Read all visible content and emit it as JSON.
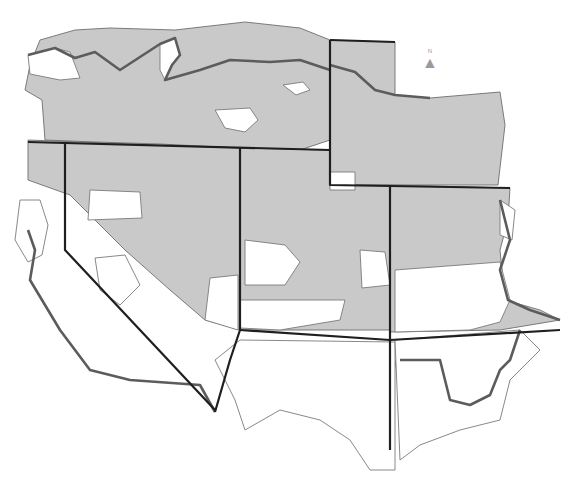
{
  "map": {
    "title": "",
    "background": "#ffffff",
    "colors": {
      "shaded": "#c9c9c9",
      "unshaded": "#ffffff",
      "county_border": "#6e6e6e",
      "state_border": "#1f1f1f",
      "region_border": "#5c5c5c"
    },
    "north_arrow": {
      "label": "N",
      "glyph": "▲"
    },
    "legend": {
      "shaded_meaning": "shaded county",
      "unshaded_meaning": "unshaded county"
    },
    "shaded_regions": [
      "M 40 40 L 75 30 L 110 28 L 175 30 L 245 22 L 300 28 L 330 40 L 330 140 L 300 150 L 240 148 L 200 146 L 160 144 L 95 142 L 45 140 L 42 100 L 25 90 L 30 65 Z",
      "M 330 40 L 395 42 L 395 95 L 430 98 L 500 92 L 505 125 L 498 185 L 330 185 Z",
      "M 28 140 L 240 148 L 240 330 L 205 320 L 170 290 L 125 250 L 70 195 L 28 180 Z",
      "M 240 148 L 330 150 L 330 185 L 390 185 L 390 330 L 240 330 Z",
      "M 390 185 L 510 188 L 508 220 L 500 250 L 505 300 L 540 310 L 560 320 L 500 330 L 390 332 Z",
      "M 395 360 L 440 360 L 440 385 L 420 390 L 400 395 Z"
    ],
    "unshaded_regions": [
      "M 28 55 L 55 48 L 70 52 L 80 78 L 60 80 L 30 74 Z",
      "M 160 44 L 175 38 L 180 55 L 172 65 L 165 80 L 160 70 Z",
      "M 283 85 L 303 82 L 310 90 L 296 95 Z",
      "M 215 110 L 250 108 L 258 120 L 245 132 L 225 128 Z",
      "M 330 172 L 355 172 L 355 190 L 330 190 Z",
      "M 90 190 L 140 192 L 142 218 L 88 220 Z",
      "M 20 200 L 40 200 L 48 225 L 42 255 L 28 262 L 15 240 Z",
      "M 95 258 L 125 255 L 140 285 L 120 305 L 100 290 Z",
      "M 210 278 L 238 275 L 238 330 L 205 320 Z",
      "M 245 240 L 285 245 L 300 262 L 285 285 L 245 285 Z",
      "M 240 300 L 345 300 L 340 320 L 280 330 L 240 328 Z",
      "M 360 250 L 385 252 L 390 285 L 362 288 Z",
      "M 395 270 L 500 262 L 510 300 L 500 322 L 470 330 L 395 332 Z",
      "M 500 200 L 515 210 L 512 240 L 500 235 Z",
      "M 240 340 L 395 342 L 395 470 L 370 470 L 350 440 L 320 420 L 280 410 L 245 430 L 235 400 L 215 360 Z",
      "M 395 340 L 520 330 L 540 350 L 510 380 L 500 420 L 460 430 L 420 445 L 400 460 Z"
    ],
    "state_borders": [
      "M 28 142 L 330 150 L 330 185 L 510 188",
      "M 65 142 L 65 250 L 215 410",
      "M 240 148 L 240 330 L 230 360 L 215 412",
      "M 330 40 L 395 42",
      "M 330 40 L 330 150",
      "M 240 330 L 390 340 L 560 330",
      "M 390 185 L 390 450"
    ],
    "region_outlines": [
      "M 28 55 L 55 48 L 75 58 L 95 52 L 120 70 L 160 44 L 175 38 L 180 55 L 172 65 L 165 80 L 200 70 L 230 60 L 270 62 L 300 60 L 330 70",
      "M 330 65 L 355 72 L 375 90 L 395 95 L 430 98",
      "M 28 230 L 35 250 L 30 280 L 60 330 L 90 370 L 130 380 L 200 385 L 215 412",
      "M 400 360 L 440 360 L 450 400 L 470 405 L 490 395 L 500 370 L 510 360 L 520 330",
      "M 500 200 L 510 240 L 500 270 L 508 300 L 530 310 L 560 320"
    ]
  }
}
